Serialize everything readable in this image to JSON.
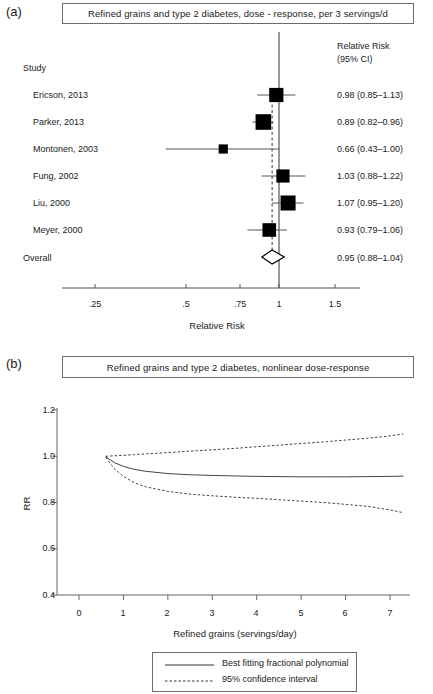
{
  "figure": {
    "panel_a_letter": "(a)",
    "panel_b_letter": "(b)"
  },
  "forest": {
    "title": "Refined grains and type 2 diabetes, dose - response, per 3 servings/d",
    "study_column_header": "Study",
    "rr_column_header_line1": "Relative Risk",
    "rr_column_header_line2": "(95% CI)",
    "overall_label": "Overall",
    "axis_title": "Relative Risk",
    "axis_ticks": [
      ".25",
      ".5",
      ".75",
      "1",
      "1.5"
    ],
    "rows": [
      {
        "study": "Ericson, 2013",
        "rr_text": "0.98 (0.85–1.13)",
        "rr": 0.98,
        "lower": 0.85,
        "upper": 1.13
      },
      {
        "study": "Parker, 2013",
        "rr_text": "0.89 (0.82–0.96)",
        "rr": 0.89,
        "lower": 0.82,
        "upper": 0.96
      },
      {
        "study": "Montonen, 2003",
        "rr_text": "0.66 (0.43–1.00)",
        "rr": 0.66,
        "lower": 0.43,
        "upper": 1.0
      },
      {
        "study": "Fung, 2002",
        "rr_text": "1.03 (0.88–1.22)",
        "rr": 1.03,
        "lower": 0.88,
        "upper": 1.22
      },
      {
        "study": "Liu, 2000",
        "rr_text": "1.07 (0.95–1.20)",
        "rr": 1.07,
        "lower": 0.95,
        "upper": 1.2
      },
      {
        "study": "Meyer, 2000",
        "rr_text": "0.93 (0.79–1.06)",
        "rr": 0.93,
        "lower": 0.79,
        "upper": 1.06
      }
    ],
    "overall": {
      "rr_text": "0.95 (0.88–1.04)",
      "rr": 0.95,
      "lower": 0.88,
      "upper": 1.04
    },
    "null_line_value": 1.0
  },
  "chart_data": [
    {
      "type": "forest",
      "title": "Refined grains and type 2 diabetes, dose - response, per 3 servings/d",
      "xlabel": "Relative Risk",
      "ylabel": "Study",
      "xscale": "log",
      "xlim": [
        0.22,
        1.75
      ],
      "xticks": [
        0.25,
        0.5,
        0.75,
        1,
        1.5
      ],
      "xticklabels": [
        ".25",
        ".5",
        ".75",
        "1",
        "1.5"
      ],
      "null_line": 1.0,
      "categories": [
        "Ericson, 2013",
        "Parker, 2013",
        "Montonen, 2003",
        "Fung, 2002",
        "Liu, 2000",
        "Meyer, 2000",
        "Overall"
      ],
      "values": [
        0.98,
        0.89,
        0.66,
        1.03,
        1.07,
        0.93,
        0.95
      ],
      "ci_lower": [
        0.85,
        0.82,
        0.43,
        0.88,
        0.95,
        0.79,
        0.88
      ],
      "ci_upper": [
        1.13,
        0.96,
        1.0,
        1.22,
        1.2,
        1.06,
        1.04
      ],
      "marker_weights": [
        0.72,
        0.86,
        0.22,
        0.62,
        0.8,
        0.66,
        1.0
      ],
      "summary_row": "Overall",
      "grid": false,
      "legend": "none"
    },
    {
      "type": "line",
      "title": "Refined grains and type 2 diabetes, nonlinear dose-response",
      "xlabel": "Refined grains (servings/day)",
      "ylabel": "RR",
      "xlim": [
        0,
        7.4
      ],
      "ylim": [
        0.4,
        1.25
      ],
      "xticks": [
        0,
        1,
        2,
        3,
        4,
        5,
        6,
        7
      ],
      "yticks": [
        0.4,
        0.6,
        0.8,
        1.0,
        1.2
      ],
      "grid": false,
      "legend_position": "below-center",
      "x": [
        0.6,
        0.8,
        1.0,
        1.25,
        1.5,
        2.0,
        2.5,
        3.0,
        3.5,
        4.0,
        4.5,
        5.0,
        5.5,
        6.0,
        6.5,
        7.0,
        7.3
      ],
      "series": [
        {
          "name": "Best fitting fractional polynomial",
          "style": "solid",
          "values": [
            0.998,
            0.972,
            0.956,
            0.943,
            0.935,
            0.925,
            0.92,
            0.917,
            0.915,
            0.913,
            0.912,
            0.911,
            0.911,
            0.911,
            0.912,
            0.913,
            0.914
          ]
        },
        {
          "name": "95% confidence interval upper",
          "style": "dashed",
          "values": [
            1.0,
            1.002,
            1.004,
            1.007,
            1.01,
            1.016,
            1.022,
            1.028,
            1.034,
            1.041,
            1.048,
            1.055,
            1.062,
            1.07,
            1.078,
            1.088,
            1.096
          ]
        },
        {
          "name": "95% confidence interval lower",
          "style": "dashed",
          "values": [
            0.995,
            0.945,
            0.913,
            0.885,
            0.868,
            0.848,
            0.836,
            0.829,
            0.823,
            0.818,
            0.812,
            0.806,
            0.8,
            0.792,
            0.783,
            0.768,
            0.756
          ]
        }
      ]
    }
  ],
  "nonlinear": {
    "title": "Refined grains and type 2 diabetes, nonlinear dose-response",
    "y_axis_title": "RR",
    "x_axis_title": "Refined grains (servings/day)",
    "y_ticks": [
      "1.2",
      "1.0",
      "0.8",
      "0.6",
      "0.4"
    ],
    "x_ticks": [
      "0",
      "1",
      "2",
      "3",
      "4",
      "5",
      "6",
      "7"
    ],
    "legend": {
      "solid_label": "Best fitting fractional polynomial",
      "dashed_label": "95% confidence interval"
    }
  },
  "colors": {
    "ink": "#1a1a1a",
    "marker": "#000000",
    "line": "#4a4a4a",
    "box_border": "#6b6b6b"
  }
}
